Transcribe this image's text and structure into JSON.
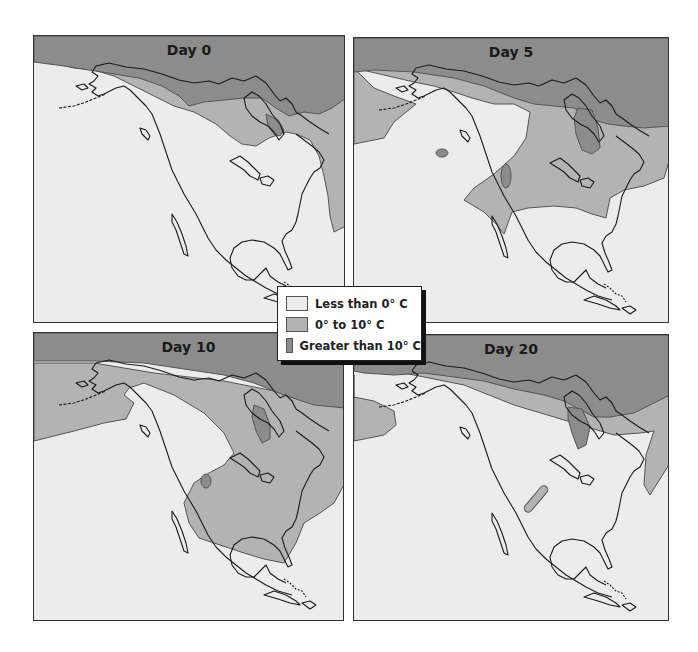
{
  "figure": {
    "panels": [
      {
        "title": "Day 0"
      },
      {
        "title": "Day 5"
      },
      {
        "title": "Day 10"
      },
      {
        "title": "Day 20"
      }
    ],
    "legend": {
      "items": [
        {
          "label": "Less than 0° C",
          "color": "#ececec"
        },
        {
          "label": "0° to 10° C",
          "color": "#b3b3b3"
        },
        {
          "label": "Greater than 10° C",
          "color": "#8c8c8c"
        }
      ]
    },
    "colors": {
      "cold": "#ececec",
      "mid": "#b3b3b3",
      "warm": "#8c8c8c",
      "coast": "#1a1a1a",
      "zone_border": "#555555"
    }
  }
}
